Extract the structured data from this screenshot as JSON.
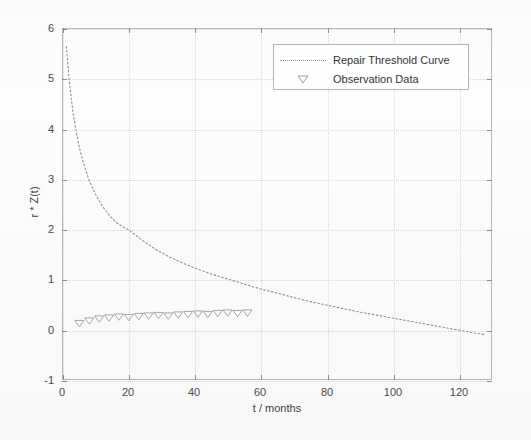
{
  "chart_data": {
    "type": "line",
    "title": "",
    "xlabel": "t / months",
    "ylabel": "r * Z(t)",
    "xlim": [
      0,
      130
    ],
    "ylim": [
      -1,
      6
    ],
    "xticks": [
      0,
      20,
      40,
      60,
      80,
      100,
      120
    ],
    "yticks": [
      -1,
      0,
      1,
      2,
      3,
      4,
      5,
      6
    ],
    "grid": true,
    "legend_position": "top-center-right",
    "legend": [
      {
        "label": "Repair Threshold Curve",
        "marker": "dotted-line",
        "color": "#8e8e8e"
      },
      {
        "label": "Observation Data",
        "marker": "triangle-down",
        "color": "#9e9e9e"
      }
    ],
    "series": [
      {
        "name": "Repair Threshold Curve",
        "style": "dotted",
        "color": "#8e8e8e",
        "x": [
          1,
          2,
          3,
          4,
          5,
          6,
          8,
          10,
          12,
          14,
          16,
          18,
          20,
          24,
          28,
          32,
          36,
          40,
          45,
          50,
          55,
          60,
          65,
          70,
          75,
          80,
          85,
          90,
          95,
          100,
          105,
          110,
          115,
          120,
          125,
          128
        ],
        "y": [
          5.65,
          4.9,
          4.35,
          3.95,
          3.62,
          3.36,
          2.96,
          2.68,
          2.45,
          2.28,
          2.14,
          2.05,
          1.98,
          1.78,
          1.6,
          1.45,
          1.33,
          1.22,
          1.1,
          1.0,
          0.9,
          0.8,
          0.72,
          0.63,
          0.55,
          0.48,
          0.41,
          0.34,
          0.28,
          0.22,
          0.16,
          0.1,
          0.04,
          -0.02,
          -0.08,
          -0.11
        ]
      },
      {
        "name": "Observation Data",
        "style": "markers",
        "marker": "triangle-down",
        "color": "#9e9e9e",
        "x": [
          5,
          8,
          11,
          14,
          17,
          20,
          23,
          26,
          29,
          32,
          35,
          38,
          41,
          44,
          47,
          50,
          53,
          56
        ],
        "y": [
          0.12,
          0.17,
          0.21,
          0.23,
          0.25,
          0.24,
          0.26,
          0.27,
          0.28,
          0.27,
          0.29,
          0.3,
          0.31,
          0.3,
          0.32,
          0.33,
          0.32,
          0.33
        ]
      }
    ]
  },
  "axes": {
    "xlabel": "t / months",
    "ylabel": "r * Z(t)",
    "xtick_labels": [
      "0",
      "20",
      "40",
      "60",
      "80",
      "100",
      "120"
    ],
    "ytick_labels": [
      "-1",
      "0",
      "1",
      "2",
      "3",
      "4",
      "5",
      "6"
    ]
  },
  "legend": {
    "items": [
      {
        "label": "Repair Threshold Curve"
      },
      {
        "label": "Observation Data"
      }
    ]
  }
}
